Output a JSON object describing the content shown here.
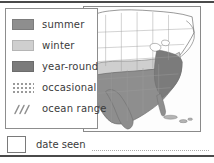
{
  "panel": {
    "title": "range map legend"
  },
  "legend": {
    "items": [
      {
        "label": "summer",
        "swatch_kind": "solid",
        "color": "#8e8e8e",
        "icon": "filled-square-icon"
      },
      {
        "label": "winter",
        "swatch_kind": "solid",
        "color": "#cfcfcf",
        "icon": "filled-square-icon"
      },
      {
        "label": "year-round",
        "swatch_kind": "solid",
        "color": "#7b7b7b",
        "icon": "filled-square-icon"
      },
      {
        "label": "occasional",
        "swatch_kind": "stipple",
        "color": "#9a9a9a",
        "icon": "dotted-square-icon"
      },
      {
        "label": "ocean range",
        "swatch_kind": "diagonal",
        "color": "#8e8e8e",
        "icon": "diagonal-hatch-icon"
      }
    ]
  },
  "date_seen": {
    "label": "date seen",
    "value": "",
    "checkbox_icon": "empty-box-icon"
  },
  "map": {
    "name": "north-america-range-map",
    "regions": [
      {
        "name": "summer-range",
        "fill": "#8e8e8e"
      },
      {
        "name": "winter-range",
        "fill": "#cfcfcf"
      },
      {
        "name": "year-round-range",
        "fill": "#7b7b7b"
      },
      {
        "name": "unshaded-land",
        "fill": "#ffffff"
      }
    ],
    "outline_color": "#6e6e6e",
    "background": "#fdfdfd"
  },
  "colors": {
    "rule": "#4a4a4a",
    "border": "#8a8a8a",
    "text": "#3b3b3b"
  }
}
